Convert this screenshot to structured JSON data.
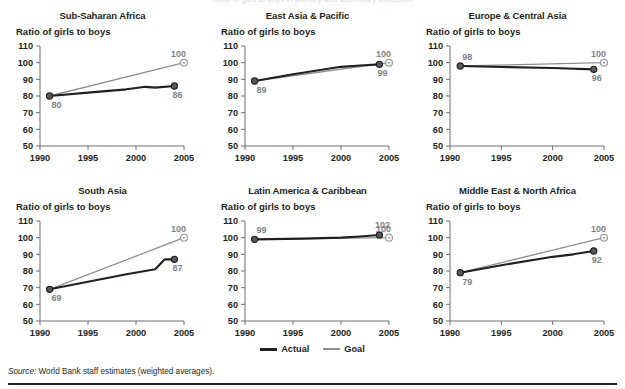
{
  "figure": {
    "source_prefix": "Source:",
    "source_text": " World Bank staff estimates (weighted averages).",
    "partial_top_text": "Ratio of girls to boys in primary and secondary education"
  },
  "legend": {
    "actual_label": "Actual",
    "goal_label": "Goal",
    "actual_color": "#231f20",
    "goal_color": "#8d8f91",
    "position": "bottom-center"
  },
  "axes": {
    "ylabel": "Ratio of girls to boys",
    "yticks": [
      50,
      60,
      70,
      80,
      90,
      100,
      110
    ],
    "ylim": [
      50,
      110
    ],
    "xticks": [
      1990,
      1995,
      2000,
      2005
    ],
    "xlim": [
      1990,
      2005
    ],
    "grid": false
  },
  "chart_data": [
    {
      "type": "line",
      "title": "Sub-Saharan Africa",
      "xlabel": "",
      "ylabel": "Ratio of girls to boys",
      "ylim": [
        50,
        110
      ],
      "xlim": [
        1990,
        2005
      ],
      "yticks": [
        50,
        60,
        70,
        80,
        90,
        100,
        110
      ],
      "xticks": [
        1990,
        1995,
        2000,
        2005
      ],
      "series": [
        {
          "name": "Actual",
          "x": [
            1991,
            1995,
            1999,
            2001,
            2002,
            2004
          ],
          "values": [
            80,
            82,
            84,
            85.5,
            85,
            86
          ],
          "start_label": "80",
          "end_label": "86"
        },
        {
          "name": "Goal",
          "x": [
            1991,
            2005
          ],
          "values": [
            80,
            100
          ],
          "end_label": "100"
        }
      ]
    },
    {
      "type": "line",
      "title": "East Asia & Pacific",
      "xlabel": "",
      "ylabel": "Ratio of girls to boys",
      "ylim": [
        50,
        110
      ],
      "xlim": [
        1990,
        2005
      ],
      "yticks": [
        50,
        60,
        70,
        80,
        90,
        100,
        110
      ],
      "xticks": [
        1990,
        1995,
        2000,
        2005
      ],
      "series": [
        {
          "name": "Actual",
          "x": [
            1991,
            1995,
            2000,
            2002,
            2004
          ],
          "values": [
            89,
            93,
            97.5,
            98.3,
            99
          ],
          "start_label": "89",
          "end_label": "99"
        },
        {
          "name": "Goal",
          "x": [
            1991,
            2005
          ],
          "values": [
            89,
            100
          ],
          "end_label": "100"
        }
      ]
    },
    {
      "type": "line",
      "title": "Europe & Central Asia",
      "xlabel": "",
      "ylabel": "Ratio of girls to boys",
      "ylim": [
        50,
        110
      ],
      "xlim": [
        1990,
        2005
      ],
      "yticks": [
        50,
        60,
        70,
        80,
        90,
        100,
        110
      ],
      "xticks": [
        1990,
        1995,
        2000,
        2005
      ],
      "series": [
        {
          "name": "Actual",
          "x": [
            1991,
            1995,
            2000,
            2004
          ],
          "values": [
            98,
            97.4,
            96.8,
            96
          ],
          "start_label": "98",
          "end_label": "96"
        },
        {
          "name": "Goal",
          "x": [
            1991,
            2005
          ],
          "values": [
            98,
            100
          ],
          "end_label": "100"
        }
      ]
    },
    {
      "type": "line",
      "title": "South Asia",
      "xlabel": "",
      "ylabel": "Ratio of girls to boys",
      "ylim": [
        50,
        110
      ],
      "xlim": [
        1990,
        2005
      ],
      "yticks": [
        50,
        60,
        70,
        80,
        90,
        100,
        110
      ],
      "xticks": [
        1990,
        1995,
        2000,
        2005
      ],
      "series": [
        {
          "name": "Actual",
          "x": [
            1991,
            1995,
            1999,
            2002,
            2003,
            2004
          ],
          "values": [
            69,
            73.5,
            78,
            81,
            87,
            87
          ],
          "start_label": "69",
          "end_label": "87"
        },
        {
          "name": "Goal",
          "x": [
            1991,
            2005
          ],
          "values": [
            69,
            100
          ],
          "end_label": "100"
        }
      ]
    },
    {
      "type": "line",
      "title": "Latin America & Caribbean",
      "xlabel": "",
      "ylabel": "Ratio of girls to boys",
      "ylim": [
        50,
        110
      ],
      "xlim": [
        1990,
        2005
      ],
      "yticks": [
        50,
        60,
        70,
        80,
        90,
        100,
        110
      ],
      "xticks": [
        1990,
        1995,
        2000,
        2005
      ],
      "series": [
        {
          "name": "Actual",
          "x": [
            1991,
            1996,
            2000,
            2002,
            2004
          ],
          "values": [
            99,
            99.4,
            100,
            100.7,
            101.6
          ],
          "start_label": "99",
          "end_label": "102"
        },
        {
          "name": "Goal",
          "x": [
            1991,
            2005
          ],
          "values": [
            99,
            100
          ],
          "end_label": "100"
        }
      ]
    },
    {
      "type": "line",
      "title": "Middle East & North Africa",
      "xlabel": "",
      "ylabel": "Ratio of girls to boys",
      "ylim": [
        50,
        110
      ],
      "xlim": [
        1990,
        2005
      ],
      "yticks": [
        50,
        60,
        70,
        80,
        90,
        100,
        110
      ],
      "xticks": [
        1990,
        1995,
        2000,
        2005
      ],
      "series": [
        {
          "name": "Actual",
          "x": [
            1991,
            1995,
            2000,
            2002,
            2004
          ],
          "values": [
            79,
            83.5,
            88.5,
            90,
            92
          ],
          "start_label": "79",
          "end_label": "92"
        },
        {
          "name": "Goal",
          "x": [
            1991,
            2005
          ],
          "values": [
            79,
            100
          ],
          "end_label": "100"
        }
      ]
    }
  ]
}
